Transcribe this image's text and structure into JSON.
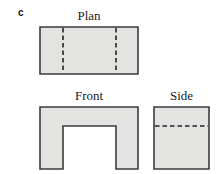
{
  "figure": {
    "part_label": "c",
    "colors": {
      "fill": "#e3e3e1",
      "stroke": "#3b3b3b",
      "hidden_line": "#232323",
      "background": "#ffffff",
      "text": "#1a1a1a"
    },
    "views": [
      {
        "key": "plan",
        "title": "Plan",
        "shape": "rectangle",
        "hidden_edges": 2,
        "hidden_edge_orientation": "vertical",
        "outline": "0,0 98,0 98,47 0,47",
        "hidden_lines": [
          {
            "x1": 23,
            "y1": 1,
            "x2": 23,
            "y2": 46
          },
          {
            "x1": 76,
            "y1": 1,
            "x2": 76,
            "y2": 46
          }
        ]
      },
      {
        "key": "front",
        "title": "Front",
        "shape": "notched-rectangle",
        "hidden_edges": 0,
        "outline": "0,0 98,0 98,62 76,62 76,19 23,19 23,62 0,62",
        "hidden_lines": []
      },
      {
        "key": "side",
        "title": "Side",
        "shape": "square",
        "hidden_edges": 1,
        "hidden_edge_orientation": "horizontal",
        "outline": "0,0 55,0 55,62 0,62",
        "hidden_lines": [
          {
            "x1": 1,
            "y1": 19,
            "x2": 54,
            "y2": 19
          }
        ]
      }
    ]
  }
}
